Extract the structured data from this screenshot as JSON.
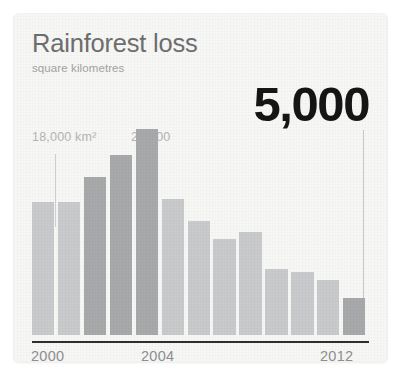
{
  "card": {
    "background_color": "#f7f7f6"
  },
  "header": {
    "title": "Rainforest loss",
    "subtitle": "square kilometres"
  },
  "headline": {
    "value": "5,000"
  },
  "annotations": [
    {
      "label": "18,000 km²",
      "bar_index": 0
    },
    {
      "label": "28,000",
      "bar_index": 4
    },
    {
      "label": "5,000",
      "bar_index": 12
    }
  ],
  "colors": {
    "bar_light": "#c9cacb",
    "bar_dark": "#a8a9aa",
    "axis": "#2f2f2f",
    "title": "#6d6e6e",
    "subtitle": "#a2a3a3",
    "annotation": "#b4b5b5",
    "headline": "#151515",
    "leader_line": "#cdcecd"
  },
  "chart_data": {
    "type": "bar",
    "title": "Rainforest loss",
    "subtitle": "square kilometres",
    "xlabel": "",
    "ylabel": "square kilometres",
    "ylim": [
      0,
      30000
    ],
    "grid": false,
    "legend": "none",
    "categories": [
      "2000",
      "2001",
      "2002",
      "2003",
      "2004",
      "2005",
      "2006",
      "2007",
      "2008",
      "2009",
      "2010",
      "2011",
      "2012"
    ],
    "tick_labels_shown": [
      "2000",
      "2004",
      "2012"
    ],
    "values": [
      18000,
      18000,
      21500,
      24500,
      28000,
      18400,
      15500,
      13000,
      14000,
      9000,
      8500,
      7500,
      5000
    ],
    "highlighted_indices": [
      2,
      3,
      4,
      12
    ],
    "data_labels": [
      {
        "category": "2000",
        "value": 18000,
        "text": "18,000 km²"
      },
      {
        "category": "2004",
        "value": 28000,
        "text": "28,000"
      },
      {
        "category": "2012",
        "value": 5000,
        "text": "5,000"
      }
    ]
  },
  "axis": {
    "ticks": [
      {
        "label": "2000"
      },
      {
        "label": "2004"
      },
      {
        "label": "2012"
      }
    ]
  }
}
